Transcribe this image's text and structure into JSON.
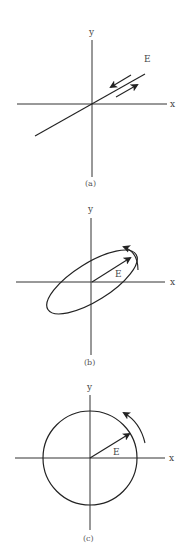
{
  "figure": {
    "panels": [
      {
        "id": "a",
        "caption": "(a)",
        "x_label": "x",
        "y_label": "y",
        "vector_label": "E",
        "description": "Linear polarization: E oscillates back and forth along a fixed line"
      },
      {
        "id": "b",
        "caption": "(b)",
        "x_label": "x",
        "y_label": "y",
        "vector_label": "E",
        "description": "Elliptical polarization: E tip traces an ellipse, rotating counterclockwise"
      },
      {
        "id": "c",
        "caption": "(c)",
        "x_label": "x",
        "y_label": "y",
        "vector_label": "E",
        "description": "Circular polarization: E tip traces a circle, rotating counterclockwise"
      }
    ],
    "colors": {
      "line": "#222222",
      "text": "#444444"
    }
  }
}
